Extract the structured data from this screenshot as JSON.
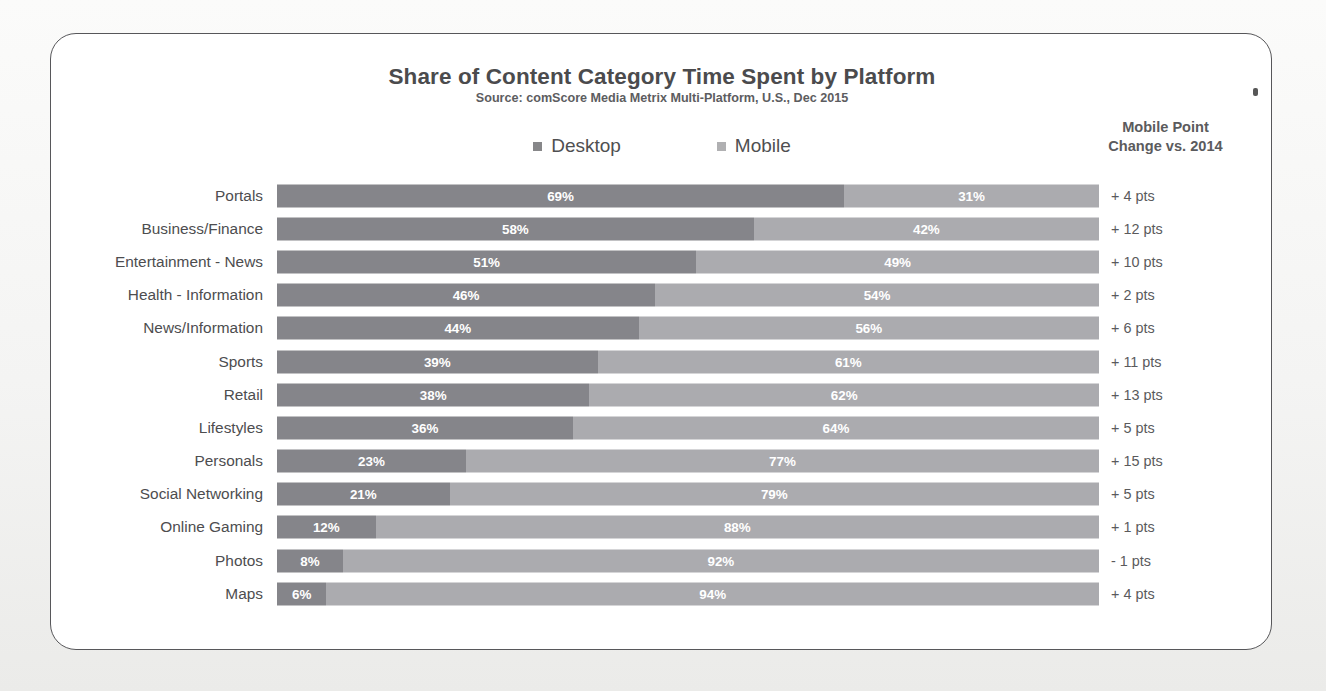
{
  "card": {
    "title": "Share of Content Category Time Spent by Platform",
    "source": "Source: comScore Media Metrix Multi-Platform, U.S., Dec 2015",
    "right_header_line1": "Mobile Point",
    "right_header_line2": "Change vs. 2014"
  },
  "legend": {
    "items": [
      {
        "label": "Desktop",
        "swatch": "desktop-legend-swatch",
        "color": "#878789"
      },
      {
        "label": "Mobile",
        "swatch": "mobile-legend-swatch",
        "color": "#b0b0b2"
      }
    ]
  },
  "chart_data": {
    "type": "bar",
    "orientation": "horizontal",
    "stacked": true,
    "normalized": true,
    "title": "Share of Content Category Time Spent by Platform",
    "subtitle": "Source: comScore Media Metrix Multi-Platform, U.S., Dec 2015",
    "xlabel": "",
    "ylabel": "",
    "xlim": [
      0,
      100
    ],
    "grid": false,
    "legend_position": "top-center",
    "categories": [
      "Portals",
      "Business/Finance",
      "Entertainment - News",
      "Health - Information",
      "News/Information",
      "Sports",
      "Retail",
      "Lifestyles",
      "Personals",
      "Social Networking",
      "Online Gaming",
      "Photos",
      "Maps"
    ],
    "series": [
      {
        "name": "Desktop",
        "color": "#85858a",
        "values": [
          69,
          58,
          51,
          46,
          44,
          39,
          38,
          36,
          23,
          21,
          12,
          8,
          6
        ],
        "labels": [
          "69%",
          "58%",
          "51%",
          "46%",
          "44%",
          "39%",
          "38%",
          "36%",
          "23%",
          "21%",
          "12%",
          "8%",
          "6%"
        ]
      },
      {
        "name": "Mobile",
        "color": "#ababaf",
        "values": [
          31,
          42,
          49,
          54,
          56,
          61,
          62,
          64,
          77,
          79,
          88,
          92,
          94
        ],
        "labels": [
          "31%",
          "42%",
          "49%",
          "54%",
          "56%",
          "61%",
          "62%",
          "64%",
          "77%",
          "79%",
          "88%",
          "92%",
          "94%"
        ]
      }
    ],
    "annotation_column": {
      "header": "Mobile Point Change vs. 2014",
      "values": [
        "+ 4 pts",
        "+ 12 pts",
        "+ 10 pts",
        "+ 2 pts",
        "+ 6 pts",
        "+ 11 pts",
        "+ 13 pts",
        "+ 5 pts",
        "+ 15 pts",
        "+ 5 pts",
        "+ 1 pts",
        "- 1 pts",
        "+ 4 pts"
      ]
    }
  }
}
